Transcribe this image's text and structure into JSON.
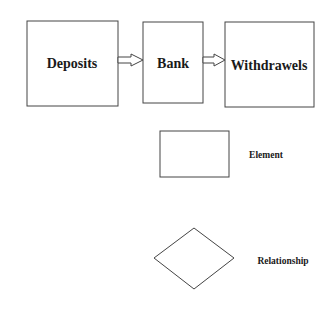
{
  "diagram": {
    "nodes": [
      {
        "id": "deposits",
        "label": "Deposits",
        "shape": "rectangle"
      },
      {
        "id": "bank",
        "label": "Bank",
        "shape": "rectangle"
      },
      {
        "id": "withdrawels",
        "label": "Withdrawels",
        "shape": "rectangle"
      }
    ],
    "edges": [
      {
        "from": "deposits",
        "to": "bank",
        "style": "hollow-block-arrow"
      },
      {
        "from": "bank",
        "to": "withdrawels",
        "style": "hollow-block-arrow"
      }
    ]
  },
  "legend": {
    "items": [
      {
        "shape": "rectangle",
        "label": "Element"
      },
      {
        "shape": "diamond",
        "label": "Relationship"
      }
    ]
  },
  "colors": {
    "stroke": "#333333",
    "background": "#ffffff",
    "text": "#1a1a1a"
  }
}
